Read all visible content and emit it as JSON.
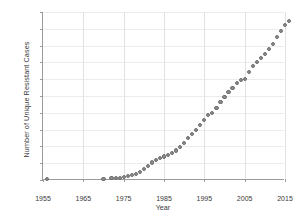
{
  "chart_data": {
    "type": "scatter",
    "title": "",
    "xlabel": "Year",
    "ylabel": "Number of Unique Resistant Cases",
    "xlim": [
      1955,
      2015
    ],
    "ylim": [
      0,
      500
    ],
    "xticks": [
      1955,
      1965,
      1975,
      1985,
      1995,
      2005,
      2015
    ],
    "yticks": [
      0,
      50,
      100,
      150,
      200,
      250,
      300,
      350,
      400,
      450,
      500
    ],
    "grid": true,
    "legend": null,
    "marker_color": "#8d8d8d",
    "marker_edge_color": "#6f6f6f",
    "x": [
      1956,
      1970,
      1972,
      1973,
      1974,
      1975,
      1976,
      1977,
      1978,
      1979,
      1980,
      1981,
      1982,
      1983,
      1984,
      1985,
      1986,
      1987,
      1988,
      1989,
      1990,
      1991,
      1992,
      1993,
      1994,
      1995,
      1996,
      1997,
      1998,
      1999,
      2000,
      2001,
      2002,
      2003,
      2004,
      2005,
      2006,
      2007,
      2008,
      2009,
      2010,
      2011,
      2012,
      2013,
      2014,
      2015,
      2016
    ],
    "y": [
      2,
      4,
      5,
      6,
      7,
      9,
      11,
      14,
      18,
      24,
      32,
      42,
      52,
      60,
      66,
      70,
      74,
      80,
      88,
      98,
      110,
      124,
      138,
      150,
      163,
      178,
      193,
      200,
      215,
      232,
      248,
      262,
      275,
      288,
      297,
      300,
      322,
      340,
      352,
      363,
      375,
      390,
      405,
      425,
      443,
      462,
      474
    ]
  }
}
